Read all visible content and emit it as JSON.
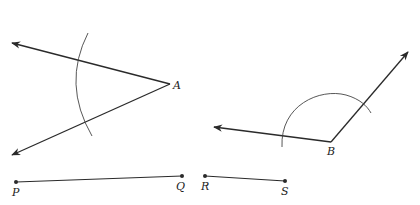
{
  "diagram": {
    "type": "geometric-construction",
    "angles": [
      {
        "vertex_label": "A",
        "vertex": [
          170,
          84
        ],
        "ray1_tip": [
          12,
          43
        ],
        "ray2_tip": [
          12,
          155
        ],
        "arc": {
          "center": [
            170,
            84
          ],
          "radius": 88,
          "start_deg": 152,
          "end_deg": 210
        }
      },
      {
        "vertex_label": "B",
        "vertex": [
          331,
          142
        ],
        "ray1_tip": [
          214,
          127
        ],
        "ray2_tip": [
          408,
          52
        ],
        "arc": {
          "center": [
            331,
            142
          ],
          "radius": 50,
          "from": [
            282,
            147
          ],
          "to": [
            370,
            112
          ]
        }
      }
    ],
    "segments": [
      {
        "name": "PQ",
        "start_label": "P",
        "end_label": "Q",
        "start": [
          16,
          182
        ],
        "end": [
          182,
          176
        ]
      },
      {
        "name": "RS",
        "start_label": "R",
        "end_label": "S",
        "start": [
          205,
          176
        ],
        "end": [
          285,
          181
        ]
      }
    ],
    "labels": {
      "A": "A",
      "B": "B",
      "P": "P",
      "Q": "Q",
      "R": "R",
      "S": "S"
    },
    "colors": {
      "stroke": "#2a2a2a",
      "arc": "#444444",
      "background": "#ffffff"
    }
  }
}
